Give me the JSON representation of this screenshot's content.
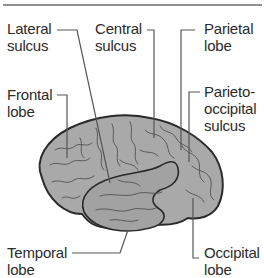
{
  "diagram": {
    "colors": {
      "brain_fill": "#a9a9a9",
      "brain_outline": "#2a2a2a",
      "sulci": "#5a5a5a",
      "leader_line": "#555555",
      "text": "#2b2b2b",
      "top_rule": "#6a6a6a"
    },
    "labels": {
      "lateral_sulcus": "Lateral\nsulcus",
      "central_sulcus": "Central\nsulcus",
      "parietal_lobe": "Parietal\nlobe",
      "frontal_lobe": "Frontal\nlobe",
      "parieto_occipital_sulcus": "Parieto-\noccipital\nsulcus",
      "temporal_lobe": "Temporal\nlobe",
      "occipital_lobe": "Occipital\nlobe"
    }
  }
}
